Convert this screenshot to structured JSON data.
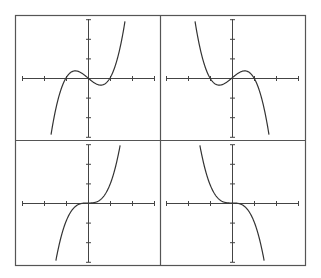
{
  "colors": {
    "background": "#ffffff",
    "frame": "#555555",
    "axis": "#444444",
    "curve": "#333333"
  },
  "chart_data": [
    {
      "type": "line",
      "panel": "top-left",
      "title": "",
      "description": "Cubic with positive leading coefficient, roots at -1, 0, 1",
      "function": "y = x^3 - x",
      "roots": [
        -1,
        0,
        1
      ],
      "x_ticks": [
        -3,
        -2,
        -1,
        0,
        1,
        2,
        3
      ],
      "y_ticks": [
        -3,
        -2,
        -1,
        0,
        1,
        2,
        3
      ],
      "xlim": [
        -3,
        3
      ],
      "ylim": [
        -3,
        3
      ],
      "grid": false
    },
    {
      "type": "line",
      "panel": "top-right",
      "title": "",
      "description": "Cubic with negative leading coefficient, roots at -1, 0, 1",
      "function": "y = -(x^3 - x)",
      "roots": [
        -1,
        0,
        1
      ],
      "x_ticks": [
        -3,
        -2,
        -1,
        0,
        1,
        2,
        3
      ],
      "y_ticks": [
        -3,
        -2,
        -1,
        0,
        1,
        2,
        3
      ],
      "xlim": [
        -3,
        3
      ],
      "ylim": [
        -3,
        3
      ],
      "grid": false
    },
    {
      "type": "line",
      "panel": "bottom-left",
      "title": "",
      "description": "Increasing cubic with triple root at 0",
      "function": "y = x^3",
      "roots": [
        0
      ],
      "x_ticks": [
        -3,
        -2,
        -1,
        0,
        1,
        2,
        3
      ],
      "y_ticks": [
        -3,
        -2,
        -1,
        0,
        1,
        2,
        3
      ],
      "xlim": [
        -3,
        3
      ],
      "ylim": [
        -3,
        3
      ],
      "grid": false
    },
    {
      "type": "line",
      "panel": "bottom-right",
      "title": "",
      "description": "Decreasing cubic with triple root at 0",
      "function": "y = -x^3",
      "roots": [
        0
      ],
      "x_ticks": [
        -3,
        -2,
        -1,
        0,
        1,
        2,
        3
      ],
      "y_ticks": [
        -3,
        -2,
        -1,
        0,
        1,
        2,
        3
      ],
      "xlim": [
        -3,
        3
      ],
      "ylim": [
        -3,
        3
      ],
      "grid": false
    }
  ]
}
